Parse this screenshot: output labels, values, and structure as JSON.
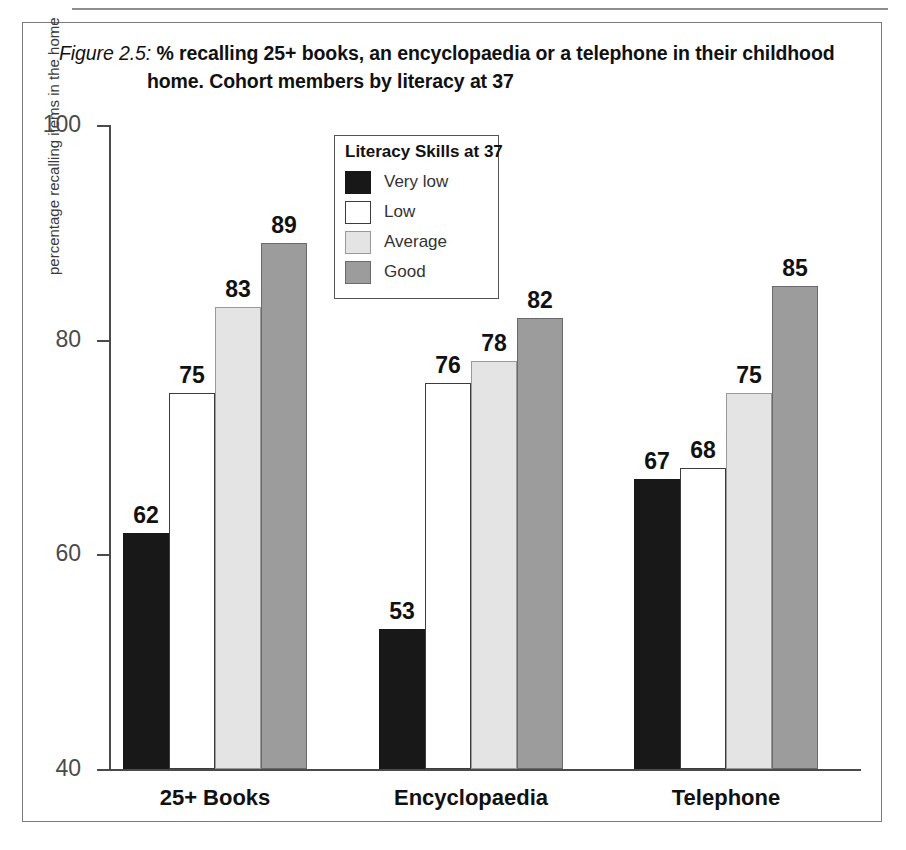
{
  "figure": {
    "number_label": "Figure 2.5:",
    "title_line1": " % recalling 25+ books, an encyclopaedia or a telephone in their childhood",
    "title_line2": "home. Cohort members by literacy at 37"
  },
  "legend": {
    "title": "Literacy Skills at 37",
    "entries": [
      {
        "label": "Very low",
        "color": "#181818"
      },
      {
        "label": "Low",
        "color": "#ffffff"
      },
      {
        "label": "Average",
        "color": "#e4e4e4"
      },
      {
        "label": "Good",
        "color": "#9c9c9c"
      }
    ]
  },
  "chart_data": {
    "type": "bar",
    "title": "Figure 2.5: % recalling 25+ books, an encyclopaedia or a telephone in their childhood home. Cohort members by literacy at 37",
    "xlabel": "",
    "ylabel": "percentage recalling items in the home",
    "ylim": [
      40,
      100
    ],
    "yticks": [
      40,
      60,
      80,
      100
    ],
    "ytick_labels": [
      "40",
      "60",
      "80",
      "100"
    ],
    "grid": false,
    "legend_position": "upper-center",
    "legend_title": "Literacy Skills at 37",
    "categories": [
      "25+ Books",
      "Encyclopaedia",
      "Telephone"
    ],
    "series": [
      {
        "name": "Very low",
        "color": "#181818",
        "values": [
          62,
          53,
          67
        ]
      },
      {
        "name": "Low",
        "color": "#ffffff",
        "values": [
          75,
          76,
          68
        ]
      },
      {
        "name": "Average",
        "color": "#e4e4e4",
        "values": [
          83,
          78,
          75
        ]
      },
      {
        "name": "Good",
        "color": "#9c9c9c",
        "values": [
          89,
          82,
          85
        ]
      }
    ]
  }
}
